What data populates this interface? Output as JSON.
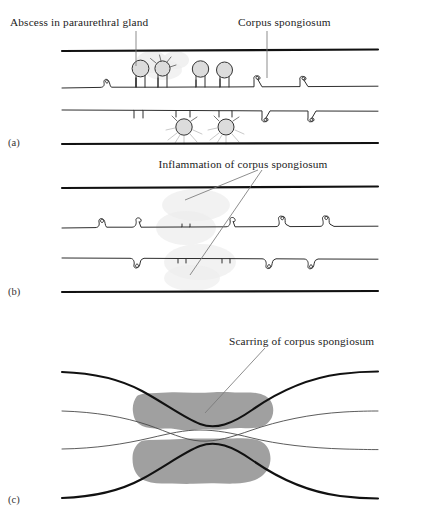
{
  "figure": {
    "type": "medical-illustration",
    "background_color": "#ffffff",
    "ink_color": "#111111",
    "scar_color": "#a0a0a0",
    "gland_fill_color": "#dcdcdc",
    "leader_color": "#7a7a7a"
  },
  "labels": {
    "abscess": "Abscess in paraurethral gland",
    "corpus_spongiosum": "Corpus spongiosum",
    "inflammation": "Inflammation of corpus spongiosum",
    "scarring": "Scarring of corpus spongiosum"
  },
  "panels": [
    {
      "letter": "(a)",
      "stage": "Abscess formation in paraurethral glands",
      "labels": [
        "Abscess in paraurethral gland",
        "Corpus spongiosum"
      ]
    },
    {
      "letter": "(b)",
      "stage": "Inflammation spreading into corpus spongiosum",
      "labels": [
        "Inflammation of corpus spongiosum"
      ]
    },
    {
      "letter": "(c)",
      "stage": "Scarring of corpus spongiosum producing stricture",
      "labels": [
        "Scarring of corpus spongiosum"
      ]
    }
  ],
  "caption": {
    "text": ""
  }
}
